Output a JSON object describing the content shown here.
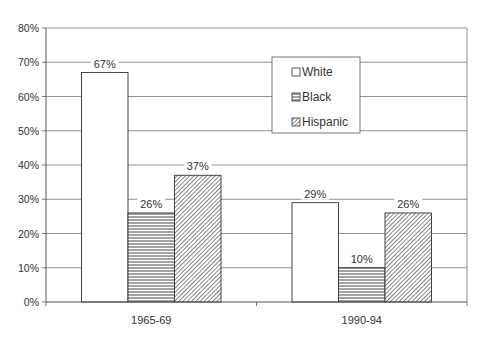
{
  "chart_data": {
    "type": "bar",
    "title": "",
    "xlabel": "",
    "ylabel": "",
    "categories": [
      "1965-69",
      "1990-94"
    ],
    "series": [
      {
        "name": "White",
        "values": [
          67,
          29
        ],
        "labels": [
          "67%",
          "29%"
        ],
        "pattern": "solid-white"
      },
      {
        "name": "Black",
        "values": [
          26,
          10
        ],
        "labels": [
          "26%",
          "10%"
        ],
        "pattern": "horizontal-lines"
      },
      {
        "name": "Hispanic",
        "values": [
          37,
          26
        ],
        "labels": [
          "37%",
          "26%"
        ],
        "pattern": "diagonal-lines"
      }
    ],
    "ylim": [
      0,
      80
    ],
    "yticks": [
      0,
      10,
      20,
      30,
      40,
      50,
      60,
      70,
      80
    ],
    "ytick_labels": [
      "0%",
      "10%",
      "20%",
      "30%",
      "40%",
      "50%",
      "60%",
      "70%",
      "80%"
    ],
    "grid": true,
    "legend_position": "upper-right-inside"
  },
  "colors": {
    "axis": "#555555",
    "grid": "#777777",
    "bar_edge": "#333333",
    "bar_fill": "#ffffff"
  }
}
